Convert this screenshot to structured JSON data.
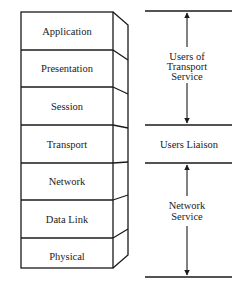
{
  "diagram": {
    "type": "OSI reference model layer stack",
    "layers": [
      {
        "name": "Application"
      },
      {
        "name": "Presentation"
      },
      {
        "name": "Session"
      },
      {
        "name": "Transport"
      },
      {
        "name": "Network"
      },
      {
        "name": "Data Link"
      },
      {
        "name": "Physical"
      }
    ],
    "groups": [
      {
        "label_lines": [
          "Users of",
          "Transport",
          "Service"
        ],
        "has_arrow": true
      },
      {
        "label_lines": [
          "Users Liaison"
        ],
        "has_arrow": false
      },
      {
        "label_lines": [
          "Network",
          "Service"
        ],
        "has_arrow": true
      }
    ],
    "colors": {
      "line": "#1a1a1a",
      "text": "#222222",
      "background": "#ffffff"
    }
  }
}
